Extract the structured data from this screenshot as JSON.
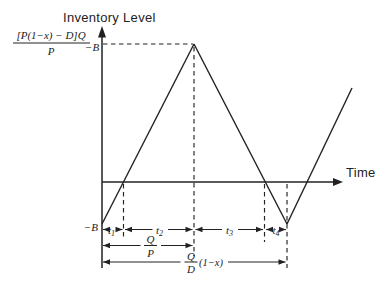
{
  "figure": {
    "y_axis_title": "Inventory Level",
    "x_axis_title": "Time",
    "peak_value_label": {
      "numerator": "[P(1−x) − D]Q",
      "denominator": "P",
      "suffix": "−B"
    },
    "backorder_label": "−B",
    "time_intervals": [
      {
        "symbol": "t",
        "subscript": "1"
      },
      {
        "symbol": "t",
        "subscript": "2"
      },
      {
        "symbol": "t",
        "subscript": "3"
      },
      {
        "symbol": "t",
        "subscript": "4"
      }
    ],
    "production_duration": {
      "numerator": "Q",
      "denominator": "P"
    },
    "cycle_duration": {
      "numerator": "Q",
      "denominator": "D",
      "suffix": "(1−x)"
    },
    "colors": {
      "ink": "#222222",
      "background": "#ffffff"
    }
  }
}
